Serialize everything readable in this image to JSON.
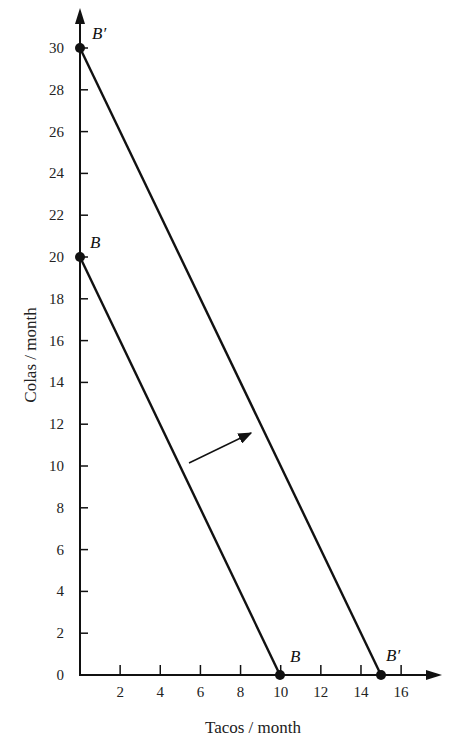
{
  "chart_data": {
    "type": "line",
    "title": "",
    "xlabel": "Tacos / month",
    "ylabel": "Colas / month",
    "xlim": [
      0,
      17
    ],
    "ylim": [
      0,
      31
    ],
    "x_ticks": [
      2,
      4,
      6,
      8,
      10,
      12,
      14,
      16
    ],
    "y_ticks": [
      0,
      2,
      4,
      6,
      8,
      10,
      12,
      14,
      16,
      18,
      20,
      22,
      24,
      26,
      28,
      30
    ],
    "grid": false,
    "series": [
      {
        "name": "B",
        "points": [
          [
            0,
            20
          ],
          [
            10,
            0
          ]
        ],
        "endpoint_labels": [
          "B",
          "B"
        ]
      },
      {
        "name": "B'",
        "points": [
          [
            0,
            30
          ],
          [
            15,
            0
          ]
        ],
        "endpoint_labels": [
          "B'",
          "B'"
        ]
      }
    ],
    "annotations": [
      {
        "type": "arrow",
        "description": "Outward shift arrow from budget line B to budget line B'"
      }
    ]
  },
  "labels": {
    "x_axis_title": "Tacos / month",
    "y_axis_title": "Colas / month",
    "origin": "0",
    "b_top": "B",
    "b_bottom": "B",
    "bp_top": "B′",
    "bp_bottom": "B′"
  },
  "ticks": {
    "x": [
      "2",
      "4",
      "6",
      "8",
      "10",
      "12",
      "14",
      "16"
    ],
    "y": [
      "2",
      "4",
      "6",
      "8",
      "10",
      "12",
      "14",
      "16",
      "18",
      "20",
      "22",
      "24",
      "26",
      "28",
      "30"
    ]
  }
}
